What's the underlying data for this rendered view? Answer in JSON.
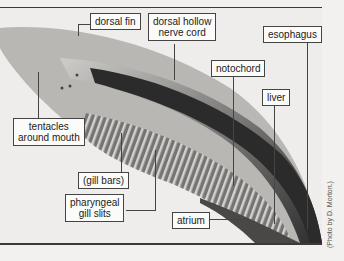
{
  "figure": {
    "labels": {
      "dorsal_fin": "dorsal fin",
      "dorsal_hollow_nerve_cord_1": "dorsal hollow",
      "dorsal_hollow_nerve_cord_2": "nerve cord",
      "esophagus": "esophagus",
      "notochord": "notochord",
      "liver": "liver",
      "tentacles_1": "tentacles",
      "tentacles_2": "around mouth",
      "gill_bars": "(gill bars)",
      "gill_slits_1": "pharyngeal",
      "gill_slits_2": "gill slits",
      "atrium": "atrium"
    },
    "credit": "(Photo by D. Morton.)",
    "colors": {
      "background": "#f2f1ef",
      "body_dark": "#2a2a2a",
      "label_border": "#444444"
    }
  }
}
